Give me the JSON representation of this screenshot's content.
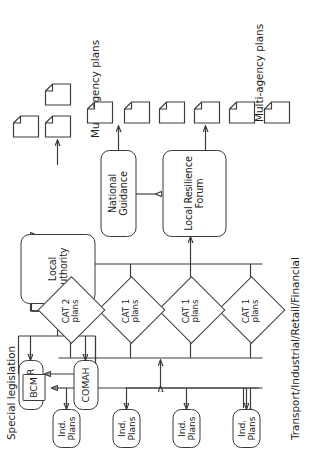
{
  "diagram": {
    "orientation": "rotated-90-ccw",
    "captions": {
      "special_legislation": "Special legislation",
      "transport_industrial": "Transport/Industrial/Retail/Financial",
      "multi_agency_top": "Multi-agency plans",
      "multi_agency_bottom": "Multi-agency plans"
    },
    "nodes": {
      "reppir": "REPPIR",
      "comah": "COMAH",
      "bcm": "BCM",
      "local_authority": "Local\nauthority",
      "local_authority_l1": "Local",
      "local_authority_l2": "authority",
      "national_guidance": "National Guidance",
      "local_resilience_forum_l1": "Local Resilience",
      "local_resilience_forum_l2": "Forum",
      "ind_plans": "Ind. Plans"
    },
    "industry_plans": [
      {
        "label": "Ind. Plans"
      },
      {
        "label": "Ind. Plans"
      },
      {
        "label": "Ind. Plans"
      },
      {
        "label": "Ind. Plans"
      }
    ],
    "category_plans": [
      {
        "line1": "CAT 1",
        "line2": "plans"
      },
      {
        "line1": "CAT 1",
        "line2": "plans"
      },
      {
        "line1": "CAT 1",
        "line2": "plans"
      },
      {
        "line1": "CAT 2",
        "line2": "plans"
      }
    ],
    "documents_top_count": 3,
    "documents_bottom_count": 6,
    "colors": {
      "stroke": "#3a3a3a",
      "text": "#1d1d1d",
      "background": "#ffffff"
    }
  }
}
